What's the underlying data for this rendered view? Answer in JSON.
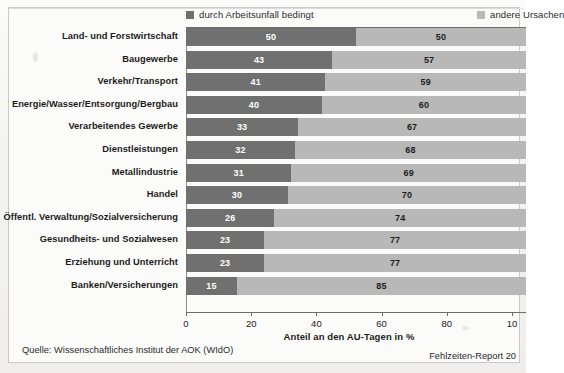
{
  "legend": {
    "items": [
      {
        "label": "durch Arbeitsunfall bedingt",
        "color": "#707070",
        "position": "left"
      },
      {
        "label": "andere Ursachen",
        "color": "#b8b8b8",
        "position": "right"
      }
    ]
  },
  "axis": {
    "xlabel": "Anteil an den AU-Tagen in %",
    "ticks": [
      "0",
      "20",
      "40",
      "60",
      "80",
      "10"
    ]
  },
  "footer": {
    "source": "Quelle: Wissenschaftliches Institut der AOK (WIdO)",
    "report": "Fehlzeiten-Report 20"
  },
  "chart_data": {
    "type": "bar",
    "orientation": "horizontal",
    "stacked": true,
    "stack_total": 100,
    "title": "",
    "xlabel": "Anteil an den AU-Tagen in %",
    "ylabel": "",
    "xlim": [
      0,
      100
    ],
    "xticks": [
      0,
      20,
      40,
      60,
      80,
      100
    ],
    "grid": false,
    "legend_position": "top",
    "categories": [
      "Land- und Forstwirtschaft",
      "Baugewerbe",
      "Verkehr/Transport",
      "Energie/Wasser/Entsorgung/Bergbau",
      "Verarbeitendes Gewerbe",
      "Dienstleistungen",
      "Metallindustrie",
      "Handel",
      "Öffentl. Verwaltung/Sozialversicherung",
      "Gesundheits- und Sozialwesen",
      "Erziehung und Unterricht",
      "Banken/Versicherungen"
    ],
    "series": [
      {
        "name": "durch Arbeitsunfall bedingt",
        "color": "#707070",
        "values": [
          50,
          43,
          41,
          40,
          33,
          32,
          31,
          30,
          26,
          23,
          23,
          15
        ]
      },
      {
        "name": "andere Ursachen",
        "color": "#b8b8b8",
        "values": [
          50,
          57,
          59,
          60,
          67,
          68,
          69,
          70,
          74,
          77,
          77,
          85
        ]
      }
    ]
  }
}
